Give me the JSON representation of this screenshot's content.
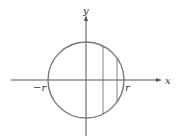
{
  "diagram": {
    "type": "circle-on-axes",
    "axes": {
      "x_label": "x",
      "y_label": "y",
      "tick_labels": {
        "left": "−r",
        "right": "r"
      }
    },
    "circle": {
      "center": [
        0,
        0
      ],
      "radius_label": "r"
    },
    "vertical_chords": 2,
    "colors": {
      "axes": "#555555",
      "circle": "#777777",
      "chords": "#666666",
      "text": "#333333"
    }
  }
}
